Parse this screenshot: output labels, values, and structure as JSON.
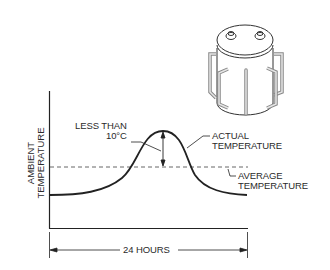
{
  "diagram": {
    "y_axis_label_line1": "AMBIENT",
    "y_axis_label_line2": "TEMPERATURE",
    "annotation_diff_line1": "LESS THAN",
    "annotation_diff_line2": "10°C",
    "annotation_actual_line1": "ACTUAL",
    "annotation_actual_line2": "TEMPERATURE",
    "annotation_average_line1": "AVERAGE",
    "annotation_average_line2": "TEMPERATURE",
    "x_dimension_label": "24 HOURS",
    "illustration": "capacitor-can-icon",
    "line_color": "#222222",
    "dashed_color": "#555555",
    "illustration_stroke": "#333333",
    "illustration_fill": "#d0d0d0"
  }
}
